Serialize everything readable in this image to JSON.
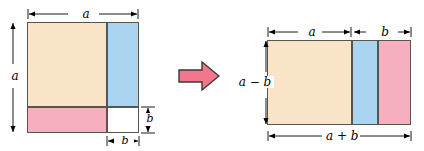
{
  "figure": {
    "colors": {
      "tan": "#fae4c8",
      "blue": "#abd4f0",
      "pink": "#f7afc0",
      "white": "#ffffff",
      "outline": "#5a544e",
      "arrow_fill": "#f2778c",
      "arrow_stroke": "#3a3a3a",
      "text": "#000000",
      "background": "#ffffff"
    },
    "transform_arrow": {
      "icon": "right-arrow-icon",
      "direction": "right"
    },
    "left_figure": {
      "name": "square-minus-notch",
      "labels": {
        "top": "a",
        "left": "a",
        "bottom_b": "b",
        "right_b": "b"
      },
      "regions": [
        {
          "name": "tan-region",
          "color": "#fae4c8"
        },
        {
          "name": "blue-region",
          "color": "#abd4f0"
        },
        {
          "name": "pink-region",
          "color": "#f7afc0"
        },
        {
          "name": "white-cutout",
          "color": "#ffffff"
        }
      ]
    },
    "right_figure": {
      "name": "rearranged-rectangle",
      "labels": {
        "top_a": "a",
        "top_b": "b",
        "left": "a − b",
        "bottom": "a + b"
      },
      "regions": [
        {
          "name": "tan-region",
          "color": "#fae4c8"
        },
        {
          "name": "blue-region",
          "color": "#abd4f0"
        },
        {
          "name": "pink-region",
          "color": "#f7afc0"
        }
      ]
    }
  }
}
